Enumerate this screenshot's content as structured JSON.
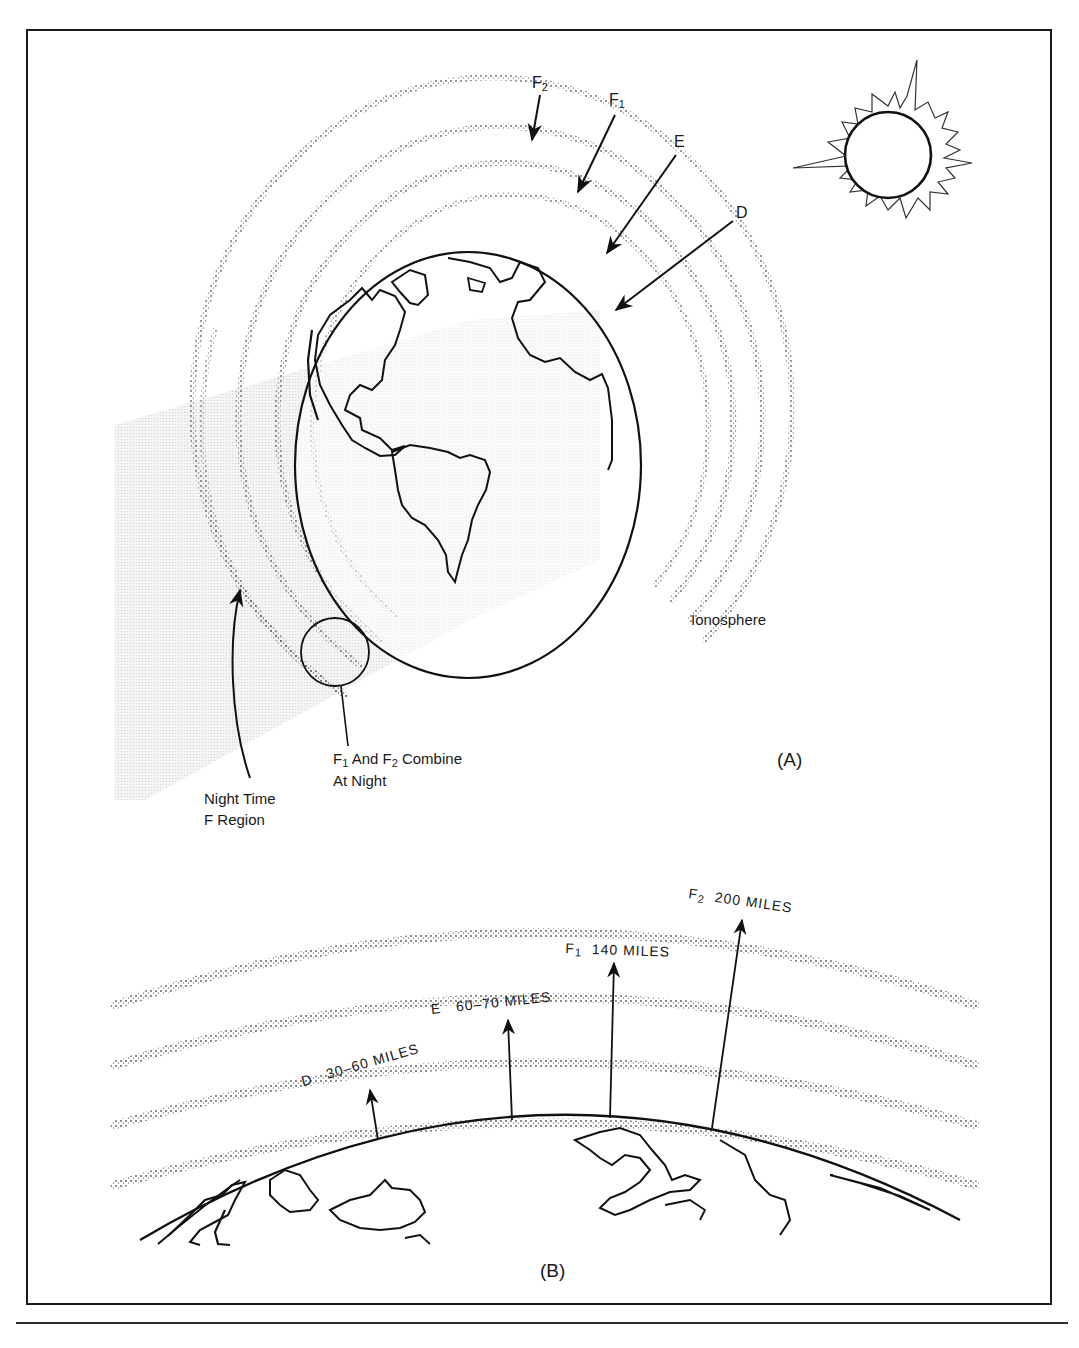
{
  "figure": {
    "panel_a": {
      "id_label": "(A)",
      "layer_labels": [
        {
          "key": "F2",
          "letter": "F",
          "sub": "2"
        },
        {
          "key": "F1",
          "letter": "F",
          "sub": "1"
        },
        {
          "key": "E",
          "letter": "E",
          "sub": ""
        },
        {
          "key": "D",
          "letter": "D",
          "sub": ""
        }
      ],
      "ionosphere_label": "Ionosphere",
      "combine_label": {
        "line1_a": "F",
        "line1_a_sub": "1",
        "line1_b": " And F",
        "line1_b_sub": "2",
        "line1_c": " Combine",
        "line2": "At Night"
      },
      "night_label": {
        "line1": "Night Time",
        "line2": "F Region"
      },
      "sun_icon": "sun-icon",
      "earth_icon": "earth-globe-icon"
    },
    "panel_b": {
      "id_label": "(B)",
      "layers": [
        {
          "letter": "D",
          "sub": "",
          "altitude": "30–60 MILES"
        },
        {
          "letter": "E",
          "sub": "",
          "altitude": "60–70 MILES"
        },
        {
          "letter": "F",
          "sub": "1",
          "altitude": "140 MILES"
        },
        {
          "letter": "F",
          "sub": "2",
          "altitude": "200 MILES"
        }
      ]
    },
    "colors": {
      "line": "#111111",
      "stipple": "#6e6e6e",
      "night_shade": "#e9e9e9"
    }
  }
}
